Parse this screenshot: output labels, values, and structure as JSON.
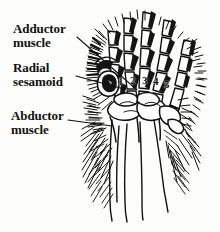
{
  "figure": {
    "kind": "anatomical-line-drawing",
    "width": 220,
    "height": 232,
    "background_color": "#fdfdfc",
    "ink_color": "#111111"
  },
  "labels": [
    {
      "id": "adductor",
      "line1": "Adductor",
      "line2": "muscle",
      "x": 13,
      "y": 22,
      "leader": {
        "x1": 77,
        "y1": 37,
        "x2": 137,
        "y2": 90
      }
    },
    {
      "id": "radial-sesamoid",
      "line1": "Radial",
      "line2": "sesamoid",
      "x": 13,
      "y": 61,
      "leader": {
        "x1": 76,
        "y1": 76,
        "x2": 124,
        "y2": 89
      }
    },
    {
      "id": "abductor",
      "line1": "Abductor",
      "line2": "muscle",
      "x": 11,
      "y": 109,
      "leader": {
        "x1": 68,
        "y1": 120,
        "x2": 112,
        "y2": 126
      }
    }
  ],
  "digit_numbers": [
    {
      "label": "1",
      "x": 118,
      "y": 81
    },
    {
      "label": "2",
      "x": 130,
      "y": 80
    },
    {
      "label": "3",
      "x": 142,
      "y": 80
    },
    {
      "label": "4",
      "x": 153,
      "y": 81
    },
    {
      "label": "5",
      "x": 164,
      "y": 84
    }
  ],
  "colors": {
    "ink": "#111111",
    "fill_light": "#ffffff",
    "fill_dark": "#1a1a1a",
    "paper": "#fdfdfc"
  }
}
